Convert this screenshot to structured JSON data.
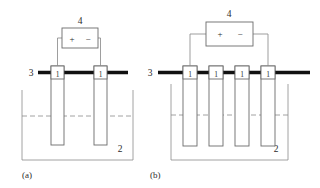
{
  "figure": {
    "background_color": "#ffffff",
    "line_color": "#8c8c8c",
    "busbar_color": "#111111",
    "text_color": "#2b2b2b",
    "panels": [
      {
        "id": "a",
        "caption": "(a)",
        "battery_label": "4",
        "battery_plus": "+",
        "battery_minus": "−",
        "busbar_label": "3",
        "tank_label": "2",
        "electrode_labels": [
          "1",
          "1"
        ],
        "electrode_count": 2
      },
      {
        "id": "b",
        "caption": "(b)",
        "battery_label": "4",
        "battery_plus": "+",
        "battery_minus": "−",
        "busbar_label": "3",
        "tank_label": "2",
        "electrode_labels": [
          "1",
          "1",
          "1",
          "1"
        ],
        "electrode_count": 4
      }
    ]
  }
}
